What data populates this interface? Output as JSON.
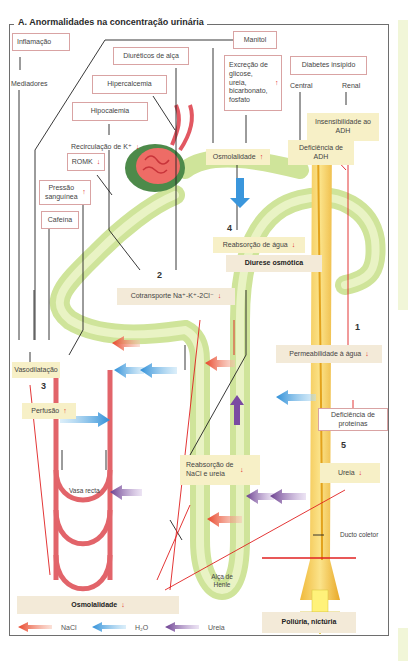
{
  "title": "A. Anormalidades na concentração urinária",
  "causes": {
    "inflamacao": "Inflamação",
    "mediadores": "Mediadores",
    "diureticos": "Diuréticos de alça",
    "manitol": "Manitol",
    "hipercalcemia": "Hipercalcemia",
    "hipocalemia": "Hipocalemia",
    "recirculacao": "Recirculação de K⁺",
    "romk": "ROMK",
    "pressao": "Pressão sanguínea",
    "cafeina": "Cafeína",
    "excrecao": "Excreção de glicose, ureia, bicarbonato, fosfato",
    "diabetes": "Diabetes insípido",
    "central": "Central",
    "renal": "Renal",
    "insensibilidade": "Insensibilidade ao ADH",
    "deficiencia_adh": "Deficiência de ADH",
    "deficiencia_prot": "Deficiência de proteínas"
  },
  "effects": {
    "osmolalidade_up": "Osmolalidade",
    "reabsorcao_agua": "Reabsorção de água",
    "diurese": "Diurese osmótica",
    "cotransporte": "Cotransporte Na⁺-K⁺-2Cl⁻",
    "vasodilatacao": "Vasodilatação",
    "perfusao": "Perfusão",
    "permeabilidade": "Permeabilidade à água",
    "reabsorcao_nacl": "Reabsorção de NaCl e ureia",
    "ureia": "Ureia",
    "osmolalidade_down": "Osmolalidade",
    "poliuria": "Poliúria, nictúria"
  },
  "structures": {
    "vasa_recta": "Vasa recta",
    "alca": "Alça de Henle",
    "ducto": "Ducto coletor"
  },
  "numbers": [
    "1",
    "2",
    "3",
    "4",
    "5"
  ],
  "arrows": {
    "up": "↑",
    "down": "↓"
  },
  "legend": [
    {
      "label": "NaCl",
      "color": "#e8452a"
    },
    {
      "label": "H₂O",
      "color": "#2f8fd8"
    },
    {
      "label": "Ureia",
      "color": "#6a3d8f"
    }
  ],
  "colors": {
    "accent_red": "#e02020",
    "tubule_green": "#cfe49a",
    "duct_yellow": "#f2c94c",
    "vessel_red": "#e2646a",
    "box_border": "#d9a3a3",
    "highlight": "#f7f0c7"
  }
}
